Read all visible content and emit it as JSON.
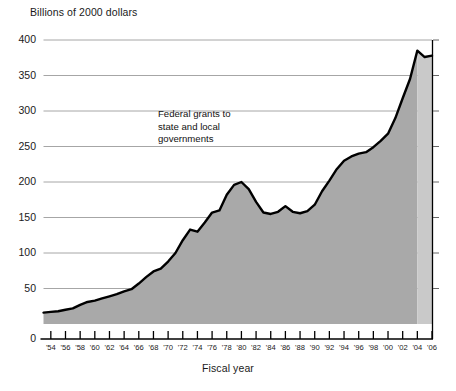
{
  "chart_data": {
    "type": "area",
    "title": "Billions of 2000 dollars",
    "xlabel": "Fiscal year",
    "ylabel": "Billions of 2000 dollars",
    "annotation": {
      "lines": [
        "Federal grants to",
        "state and local",
        "governments"
      ]
    },
    "ylim": [
      0,
      400
    ],
    "yticks": [
      0,
      50,
      100,
      150,
      200,
      250,
      300,
      350,
      400
    ],
    "ytick_labels": [
      "0",
      "50",
      "100",
      "150",
      "200",
      "250",
      "300",
      "350",
      "400"
    ],
    "xlim": [
      1953,
      2006
    ],
    "xticks": [
      1954,
      1956,
      1958,
      1960,
      1962,
      1964,
      1966,
      1968,
      1970,
      1972,
      1974,
      1976,
      1978,
      1980,
      1982,
      1984,
      1986,
      1988,
      1990,
      1992,
      1994,
      1996,
      1998,
      2000,
      2002,
      2004,
      2006
    ],
    "xtick_labels": [
      "'54",
      "'56",
      "'58",
      "'60",
      "'62",
      "'64",
      "'66",
      "'68",
      "'70",
      "'72",
      "'74",
      "'76",
      "'78",
      "'80",
      "'82",
      "'84",
      "'86",
      "'88",
      "'90",
      "'92",
      "'94",
      "'96",
      "'98",
      "'00",
      "'02",
      "'04",
      "'06"
    ],
    "grid": "horizontal",
    "legend": "none",
    "fill_color": "#a9a9a9",
    "projected_fill_color": "#c9c9c9",
    "line_color": "#000000",
    "projected_start_year": 2004,
    "x": [
      1953,
      1954,
      1955,
      1956,
      1957,
      1958,
      1959,
      1960,
      1961,
      1962,
      1963,
      1964,
      1965,
      1966,
      1967,
      1968,
      1969,
      1970,
      1971,
      1972,
      1973,
      1974,
      1975,
      1976,
      1977,
      1978,
      1979,
      1980,
      1981,
      1982,
      1983,
      1984,
      1985,
      1986,
      1987,
      1988,
      1989,
      1990,
      1991,
      1992,
      1993,
      1994,
      1995,
      1996,
      1997,
      1998,
      1999,
      2000,
      2001,
      2002,
      2003,
      2004,
      2005,
      2006
    ],
    "values": [
      16,
      17,
      18,
      20,
      22,
      27,
      31,
      33,
      36,
      39,
      42,
      46,
      49,
      57,
      66,
      74,
      78,
      88,
      100,
      118,
      133,
      130,
      143,
      157,
      160,
      182,
      196,
      200,
      190,
      172,
      157,
      155,
      158,
      166,
      158,
      156,
      159,
      168,
      187,
      202,
      218,
      230,
      236,
      240,
      242,
      249,
      258,
      268,
      290,
      318,
      345,
      385,
      376,
      378
    ],
    "series_name": "Federal grants to state and local governments"
  }
}
